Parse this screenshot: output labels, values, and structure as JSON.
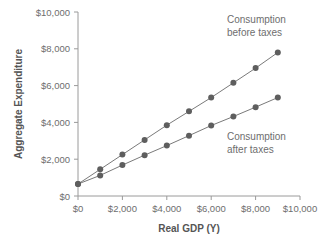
{
  "chart_data": {
    "type": "line",
    "title": "",
    "xlabel": "Real GDP (Y)",
    "ylabel": "Aggregate Expenditure",
    "xlim": [
      0,
      10000
    ],
    "ylim": [
      0,
      10000
    ],
    "grid": false,
    "legend_position": "annotations-inline",
    "x_ticks": [
      "$0",
      "$2,000",
      "$4,000",
      "$6,000",
      "$8,000",
      "$10,000"
    ],
    "x_tick_values": [
      0,
      2000,
      4000,
      6000,
      8000,
      10000
    ],
    "y_ticks": [
      "$0",
      "$2,000",
      "$4,000",
      "$6,000",
      "$8,000",
      "$10,000"
    ],
    "y_tick_values": [
      0,
      2000,
      4000,
      6000,
      8000,
      10000
    ],
    "x": [
      0,
      1000,
      2000,
      3000,
      4000,
      5000,
      6000,
      7000,
      8000,
      9000
    ],
    "series": [
      {
        "name": "Consumption before taxes",
        "values": [
          650,
          1450,
          2250,
          3050,
          3850,
          4600,
          5350,
          6150,
          6950,
          7800
        ]
      },
      {
        "name": "Consumption after taxes",
        "values": [
          650,
          1120,
          1680,
          2220,
          2740,
          3280,
          3830,
          4320,
          4830,
          5350
        ]
      }
    ],
    "annotations": [
      {
        "text_line1": "Consumption",
        "text_line2": "before taxes"
      },
      {
        "text_line1": "Consumption",
        "text_line2": "after taxes"
      }
    ],
    "colors": {
      "line": "#7a7a7a",
      "marker": "#5e5e5e",
      "axis": "#9a9a9a",
      "text": "#6e6e6e",
      "background": "#ffffff"
    }
  }
}
